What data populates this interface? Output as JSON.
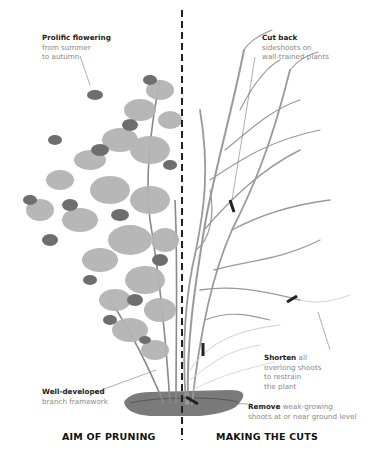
{
  "diagram": {
    "type": "illustrated-pruning-comparison",
    "divider": "dashed-vertical-line",
    "colors": {
      "background": "#ffffff",
      "heading_text": "#222222",
      "body_text": "#888888",
      "branches": "#9a9a9a",
      "foliage_light": "#b4b4b4",
      "foliage_dark": "#6e6e6e",
      "cut_marks": "#222222",
      "soil": "#6f6f6f"
    },
    "left_panel": {
      "title": "AIM OF PRUNING",
      "annotations": [
        {
          "bold": "Prolific flowering",
          "text_lines": [
            "from summer",
            "to autumn"
          ]
        },
        {
          "bold": "Well-developed",
          "text_lines": [
            "branch framework"
          ]
        }
      ]
    },
    "right_panel": {
      "title": "MAKING THE CUTS",
      "annotations": [
        {
          "bold": "Cut back",
          "text_lines": [
            "sideshoots on",
            "wall-trained plants"
          ]
        },
        {
          "bold": "Shorten",
          "bold_suffix": " all",
          "text_lines": [
            "overlong shoots",
            "to restrain",
            "the plant"
          ]
        },
        {
          "bold": "Remove",
          "bold_suffix": " weak-growing",
          "text_lines": [
            "shoots at or near ground level"
          ]
        }
      ]
    }
  }
}
